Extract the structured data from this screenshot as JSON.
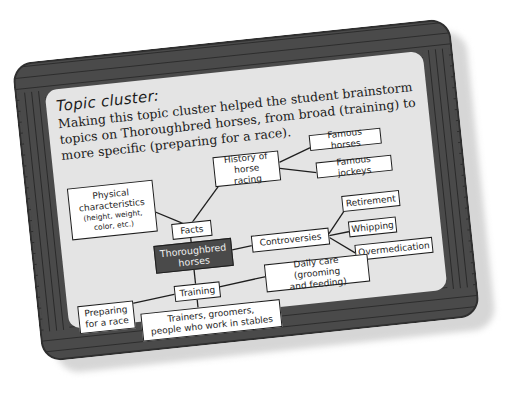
{
  "heading": "Topic cluster:",
  "description": "Making this topic cluster helped the student brainstorm topics on Thoroughbred horses, from broad (training) to more specific (preparing for a race).",
  "colors": {
    "frame": "#4a4a4a",
    "panel": "#e4e4e4",
    "node_fill": "#ffffff",
    "center_fill": "#4a4a4a",
    "line": "#1e1e1e"
  },
  "diagram": {
    "center": {
      "label_line1": "Thoroughbred",
      "label_line2": "horses"
    },
    "branches": [
      {
        "id": "facts",
        "label": "Facts",
        "children": [
          {
            "label_line1": "Physical",
            "label_line2": "characteristics",
            "detail_line1": "(height, weight,",
            "detail_line2": "color, etc.)"
          },
          {
            "label_line1": "History of",
            "label_line2": "horse racing",
            "children": [
              {
                "label": "Famous horses"
              },
              {
                "label": "Famous jockeys"
              }
            ]
          }
        ]
      },
      {
        "id": "controversies",
        "label": "Controversies",
        "children": [
          {
            "label": "Retirement"
          },
          {
            "label": "Whipping"
          },
          {
            "label": "Overmedication"
          }
        ]
      },
      {
        "id": "training",
        "label": "Training",
        "children": [
          {
            "label_line1": "Preparing",
            "label_line2": "for a race"
          },
          {
            "label_line1": "Trainers, groomers,",
            "label_line2": "people who work in stables"
          },
          {
            "label_line1": "Daily care (grooming",
            "label_line2": "and feeding)"
          }
        ]
      }
    ]
  }
}
